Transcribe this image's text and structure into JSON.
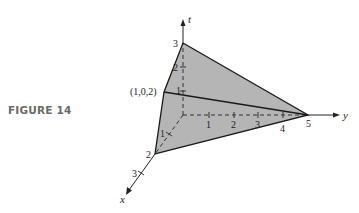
{
  "figure": {
    "label": "FIGURE 14",
    "fill_color": "#b5b5b5",
    "edge_color": "#1a1a1a",
    "axes": {
      "x": {
        "label": "x",
        "ticks": [
          "1",
          "2",
          "3"
        ]
      },
      "y": {
        "label": "y",
        "ticks": [
          "1",
          "2",
          "3",
          "4",
          "5"
        ]
      },
      "t": {
        "label": "t",
        "ticks": [
          "1",
          "2",
          "3"
        ]
      }
    },
    "vertices": [
      {
        "name": "t-intercept",
        "coords": [
          0,
          0,
          3
        ],
        "label": "3"
      },
      {
        "name": "x-intercept",
        "coords": [
          2,
          0,
          0
        ],
        "label": "2"
      },
      {
        "name": "y-intercept",
        "coords": [
          0,
          5,
          0
        ],
        "label": "5"
      },
      {
        "name": "point-1-0-2",
        "coords": [
          1,
          0,
          2
        ],
        "label": "(1,0,2)"
      }
    ]
  }
}
